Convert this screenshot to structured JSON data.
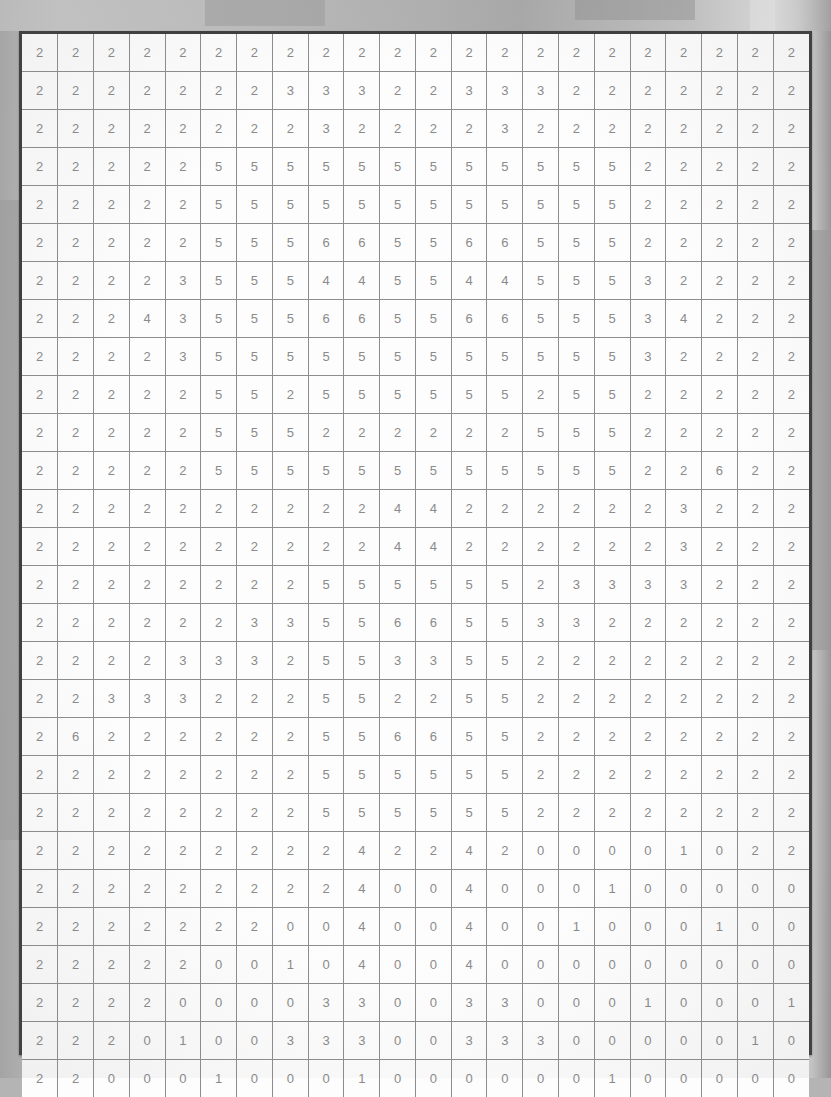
{
  "document": {
    "kind": "numeric-grid-table",
    "rows": 27,
    "columns": 22,
    "border_color": "#3d3d3d",
    "cell_border_color": "#8d8d8d",
    "cell_background": "#fdfdfd",
    "digit_color": "#8a8a8a",
    "page_background": "#b4b4b4"
  },
  "chart_data": {
    "type": "table",
    "title": "",
    "xlabel": "",
    "ylabel": "",
    "rows": 27,
    "columns": 22,
    "values": [
      [
        2,
        2,
        2,
        2,
        2,
        2,
        2,
        2,
        2,
        2,
        2,
        2,
        2,
        2,
        2,
        2,
        2,
        2,
        2,
        2,
        2,
        2
      ],
      [
        2,
        2,
        2,
        2,
        2,
        2,
        2,
        3,
        3,
        3,
        2,
        2,
        3,
        3,
        3,
        2,
        2,
        2,
        2,
        2,
        2,
        2
      ],
      [
        2,
        2,
        2,
        2,
        2,
        2,
        2,
        2,
        3,
        2,
        2,
        2,
        2,
        3,
        2,
        2,
        2,
        2,
        2,
        2,
        2,
        2
      ],
      [
        2,
        2,
        2,
        2,
        2,
        5,
        5,
        5,
        5,
        5,
        5,
        5,
        5,
        5,
        5,
        5,
        5,
        2,
        2,
        2,
        2,
        2
      ],
      [
        2,
        2,
        2,
        2,
        2,
        5,
        5,
        5,
        5,
        5,
        5,
        5,
        5,
        5,
        5,
        5,
        5,
        2,
        2,
        2,
        2,
        2
      ],
      [
        2,
        2,
        2,
        2,
        2,
        5,
        5,
        5,
        6,
        6,
        5,
        5,
        6,
        6,
        5,
        5,
        5,
        2,
        2,
        2,
        2,
        2
      ],
      [
        2,
        2,
        2,
        2,
        3,
        5,
        5,
        5,
        4,
        4,
        5,
        5,
        4,
        4,
        5,
        5,
        5,
        3,
        2,
        2,
        2,
        2
      ],
      [
        2,
        2,
        2,
        4,
        3,
        5,
        5,
        5,
        6,
        6,
        5,
        5,
        6,
        6,
        5,
        5,
        5,
        3,
        4,
        2,
        2,
        2
      ],
      [
        2,
        2,
        2,
        2,
        3,
        5,
        5,
        5,
        5,
        5,
        5,
        5,
        5,
        5,
        5,
        5,
        5,
        3,
        2,
        2,
        2,
        2
      ],
      [
        2,
        2,
        2,
        2,
        2,
        5,
        5,
        2,
        5,
        5,
        5,
        5,
        5,
        5,
        2,
        5,
        5,
        2,
        2,
        2,
        2,
        2
      ],
      [
        2,
        2,
        2,
        2,
        2,
        5,
        5,
        5,
        2,
        2,
        2,
        2,
        2,
        2,
        5,
        5,
        5,
        2,
        2,
        2,
        2,
        2
      ],
      [
        2,
        2,
        2,
        2,
        2,
        5,
        5,
        5,
        5,
        5,
        5,
        5,
        5,
        5,
        5,
        5,
        5,
        2,
        2,
        6,
        2,
        2
      ],
      [
        2,
        2,
        2,
        2,
        2,
        2,
        2,
        2,
        2,
        2,
        4,
        4,
        2,
        2,
        2,
        2,
        2,
        2,
        3,
        2,
        2,
        2
      ],
      [
        2,
        2,
        2,
        2,
        2,
        2,
        2,
        2,
        2,
        2,
        4,
        4,
        2,
        2,
        2,
        2,
        2,
        2,
        3,
        2,
        2,
        2
      ],
      [
        2,
        2,
        2,
        2,
        2,
        2,
        2,
        2,
        5,
        5,
        5,
        5,
        5,
        5,
        2,
        3,
        3,
        3,
        3,
        2,
        2,
        2
      ],
      [
        2,
        2,
        2,
        2,
        2,
        2,
        3,
        3,
        5,
        5,
        6,
        6,
        5,
        5,
        3,
        3,
        2,
        2,
        2,
        2,
        2,
        2
      ],
      [
        2,
        2,
        2,
        2,
        3,
        3,
        3,
        2,
        5,
        5,
        3,
        3,
        5,
        5,
        2,
        2,
        2,
        2,
        2,
        2,
        2,
        2
      ],
      [
        2,
        2,
        3,
        3,
        3,
        2,
        2,
        2,
        5,
        5,
        2,
        2,
        5,
        5,
        2,
        2,
        2,
        2,
        2,
        2,
        2,
        2
      ],
      [
        2,
        6,
        2,
        2,
        2,
        2,
        2,
        2,
        5,
        5,
        6,
        6,
        5,
        5,
        2,
        2,
        2,
        2,
        2,
        2,
        2,
        2
      ],
      [
        2,
        2,
        2,
        2,
        2,
        2,
        2,
        2,
        5,
        5,
        5,
        5,
        5,
        5,
        2,
        2,
        2,
        2,
        2,
        2,
        2,
        2
      ],
      [
        2,
        2,
        2,
        2,
        2,
        2,
        2,
        2,
        5,
        5,
        5,
        5,
        5,
        5,
        2,
        2,
        2,
        2,
        2,
        2,
        2,
        2
      ],
      [
        2,
        2,
        2,
        2,
        2,
        2,
        2,
        2,
        2,
        4,
        2,
        2,
        4,
        2,
        0,
        0,
        0,
        0,
        1,
        0,
        2,
        2
      ],
      [
        2,
        2,
        2,
        2,
        2,
        2,
        2,
        2,
        2,
        4,
        0,
        0,
        4,
        0,
        0,
        0,
        1,
        0,
        0,
        0,
        0,
        0
      ],
      [
        2,
        2,
        2,
        2,
        2,
        2,
        2,
        0,
        0,
        4,
        0,
        0,
        4,
        0,
        0,
        1,
        0,
        0,
        0,
        1,
        0,
        0
      ],
      [
        2,
        2,
        2,
        2,
        2,
        0,
        0,
        1,
        0,
        4,
        0,
        0,
        4,
        0,
        0,
        0,
        0,
        0,
        0,
        0,
        0,
        0
      ],
      [
        2,
        2,
        2,
        2,
        0,
        0,
        0,
        0,
        3,
        3,
        0,
        0,
        3,
        3,
        0,
        0,
        0,
        1,
        0,
        0,
        0,
        1
      ],
      [
        2,
        2,
        2,
        0,
        1,
        0,
        0,
        3,
        3,
        3,
        0,
        0,
        3,
        3,
        3,
        0,
        0,
        0,
        0,
        0,
        1,
        0
      ],
      [
        2,
        2,
        0,
        0,
        0,
        1,
        0,
        0,
        0,
        1,
        0,
        0,
        0,
        0,
        0,
        0,
        1,
        0,
        0,
        0,
        0,
        0
      ]
    ]
  }
}
